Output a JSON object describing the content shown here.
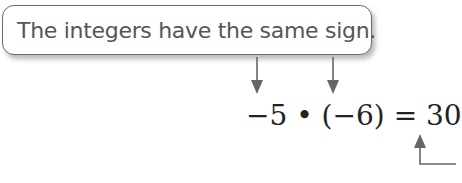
{
  "callout": {
    "text": "The integers have the same sign."
  },
  "equation": {
    "text": "−5 • (−6) = 30",
    "operand1": "−5",
    "operator": "•",
    "operand2": "(−6)",
    "equals": "=",
    "result": "30"
  },
  "colors": {
    "arrow": "#666666",
    "callout_border": "#6a6a6a",
    "callout_text": "#555555",
    "equation_text": "#222222"
  }
}
